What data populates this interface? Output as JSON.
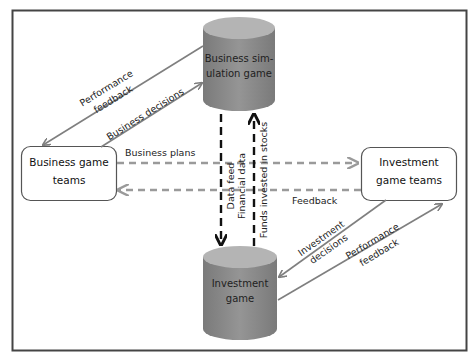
{
  "colors": {
    "frame": "#444444",
    "cylinder_body": "#8c8c8c",
    "cylinder_top": "#b4b4b4",
    "box_stroke": "#555555",
    "diag_arrow": "#7f7f7f",
    "horiz_dash": "#9a9a9a",
    "vert_dash": "#111111"
  },
  "nodes": {
    "business_sim": {
      "line1": "Business sim-",
      "line2": "ulation game"
    },
    "investment_game": {
      "line1": "Investment",
      "line2": "game"
    },
    "business_teams": {
      "line1": "Business game",
      "line2": "teams"
    },
    "investment_teams": {
      "line1": "Investment",
      "line2": "game teams"
    }
  },
  "edges": {
    "perf_feedback_top": {
      "line1": "Performance",
      "line2": "feedback"
    },
    "business_decisions": {
      "label": "Business decisions"
    },
    "business_plans": {
      "label": "Business plans"
    },
    "feedback": {
      "label": "Feedback"
    },
    "data_feed": {
      "label": "Data feed"
    },
    "financial_data": {
      "label": "Financial data"
    },
    "funds_invested": {
      "label": "Funds invested in stocks"
    },
    "investment_decisions": {
      "line1": "Investment",
      "line2": "decisions"
    },
    "perf_feedback_bottom": {
      "line1": "Performance",
      "line2": "feedback"
    }
  }
}
